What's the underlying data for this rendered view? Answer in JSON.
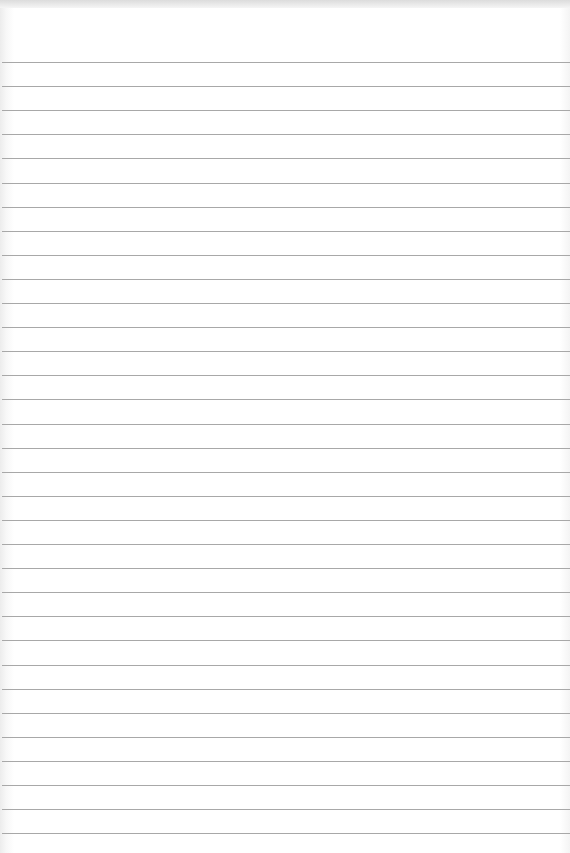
{
  "page": {
    "type": "lined-paper",
    "background_color": "#ffffff",
    "rule_color": "#a8a8a8",
    "rule_count": 33,
    "first_rule_y": 62,
    "rule_spacing": 24.1
  }
}
